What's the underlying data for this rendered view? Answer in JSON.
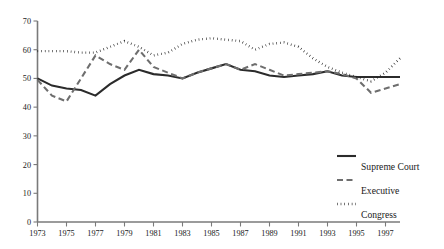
{
  "chart_data": {
    "type": "line",
    "title": "",
    "subtitle": "",
    "xlabel": "",
    "ylabel": "",
    "xlim": [
      1973,
      1998
    ],
    "ylim": [
      0,
      70
    ],
    "y_ticks": [
      0,
      10,
      20,
      30,
      40,
      50,
      60,
      70
    ],
    "x_ticks": [
      1973,
      1975,
      1977,
      1979,
      1981,
      1983,
      1985,
      1987,
      1989,
      1991,
      1993,
      1995,
      1997
    ],
    "x": [
      1973,
      1974,
      1975,
      1976,
      1977,
      1978,
      1979,
      1980,
      1981,
      1982,
      1983,
      1984,
      1985,
      1986,
      1987,
      1988,
      1989,
      1990,
      1991,
      1992,
      1993,
      1994,
      1995,
      1996,
      1997,
      1998
    ],
    "grid": false,
    "legend_position": "right-bottom",
    "series": [
      {
        "name": "Supreme Court",
        "style": "solid",
        "color": "#2b2b2b",
        "values": [
          50,
          47.5,
          46.5,
          46,
          44,
          48,
          51,
          53,
          51.5,
          51,
          50,
          52,
          53.5,
          55,
          53,
          52.5,
          51,
          50.5,
          51,
          51.5,
          52.5,
          51,
          50.5,
          50.5,
          50.5,
          50.5
        ]
      },
      {
        "name": "Executive",
        "style": "dashed",
        "color": "#6e6e6e",
        "values": [
          49.5,
          44,
          42,
          50,
          58,
          55,
          53,
          60,
          54,
          52,
          50,
          52,
          53.5,
          55,
          53,
          55,
          53,
          51,
          51.5,
          52,
          52.5,
          51.5,
          50,
          45,
          46.5,
          48
        ]
      },
      {
        "name": "Congress",
        "style": "dotted",
        "color": "#1a1a1a",
        "values": [
          59.5,
          59.5,
          59.5,
          59,
          59,
          61,
          63,
          61,
          58,
          59,
          62,
          63.5,
          64,
          63.5,
          63,
          60,
          62,
          62.5,
          61,
          57,
          54,
          52,
          50.5,
          49,
          52,
          57
        ]
      }
    ]
  },
  "legend": {
    "items": [
      {
        "label": "Supreme Court",
        "style": "solid",
        "color": "#2b2b2b"
      },
      {
        "label": "Executive",
        "style": "dashed",
        "color": "#6e6e6e"
      },
      {
        "label": "Congress",
        "style": "dotted",
        "color": "#1a1a1a"
      }
    ]
  }
}
